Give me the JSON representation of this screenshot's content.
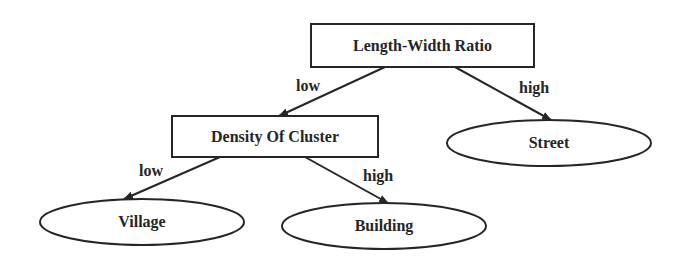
{
  "diagram": {
    "type": "decision-tree",
    "colors": {
      "stroke": "#262626",
      "text": "#262626",
      "background": "#ffffff"
    },
    "nodes": {
      "root": {
        "label": "Length-Width Ratio",
        "shape": "rectangle"
      },
      "density": {
        "label": "Density Of Cluster",
        "shape": "rectangle"
      },
      "street": {
        "label": "Street",
        "shape": "ellipse"
      },
      "village": {
        "label": "Village",
        "shape": "ellipse"
      },
      "building": {
        "label": "Building",
        "shape": "ellipse"
      }
    },
    "edges": {
      "root_low": {
        "from": "Length-Width Ratio",
        "to": "Density Of Cluster",
        "label": "low"
      },
      "root_high": {
        "from": "Length-Width Ratio",
        "to": "Street",
        "label": "high"
      },
      "density_low": {
        "from": "Density Of Cluster",
        "to": "Village",
        "label": "low"
      },
      "density_high": {
        "from": "Density Of Cluster",
        "to": "Building",
        "label": "high"
      }
    }
  }
}
